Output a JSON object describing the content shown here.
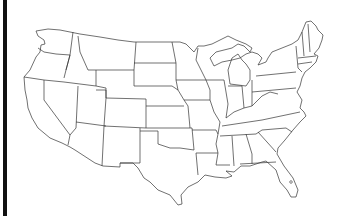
{
  "map": {
    "title": "",
    "type": "blank outline map",
    "region": "Contiguous United States",
    "labels": [],
    "colors": {
      "background": "#ffffff",
      "stroke": "#333333",
      "left_bar": "#111111"
    }
  }
}
